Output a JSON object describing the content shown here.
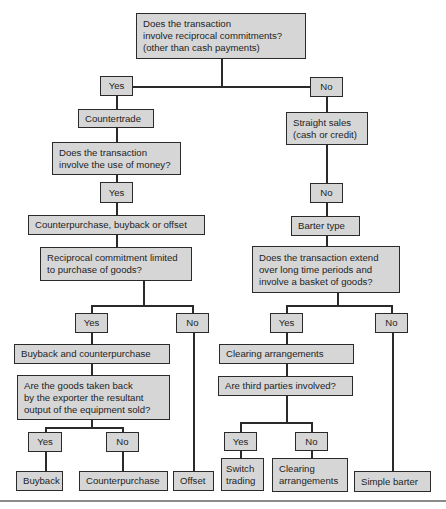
{
  "diagram": {
    "type": "decision-tree",
    "root": {
      "question": "Does the transaction\ninvolve reciprocal commitments?\n(other than cash payments)"
    },
    "left": {
      "answer": "Yes",
      "category": "Countertrade",
      "question": "Does the transaction\ninvolve the use of money?",
      "answer2": "Yes",
      "category2": "Counterpurchase, buyback or offset",
      "question2": "Reciprocal commitment limited\nto purchase of goods?",
      "yes": {
        "answer": "Yes",
        "category": "Buyback and counterpurchase",
        "question": "Are the goods taken back\nby the exporter the resultant\noutput of the equipment sold?",
        "yes_answer": "Yes",
        "yes_result": "Buyback",
        "no_answer": "No",
        "no_result": "Counterpurchase"
      },
      "no": {
        "answer": "No",
        "result": "Offset"
      }
    },
    "right": {
      "answer": "No",
      "category": "Straight sales\n(cash or credit)",
      "answer2": "No",
      "category2": "Barter type",
      "question": "Does the transaction extend\nover long time periods and\ninvolve a basket of goods?",
      "yes": {
        "answer": "Yes",
        "category": "Clearing arrangements",
        "question": "Are third parties involved?",
        "yes_answer": "Yes",
        "yes_result": "Switch\ntrading",
        "no_answer": "No",
        "no_result": "Clearing\narrangements"
      },
      "no": {
        "answer": "No",
        "result": "Simple barter"
      }
    },
    "colors": {
      "box_fill": "#d6d6d6",
      "box_border": "#2a2a2a",
      "line": "#2a2a2a",
      "rule": "#8a8a8a"
    }
  }
}
